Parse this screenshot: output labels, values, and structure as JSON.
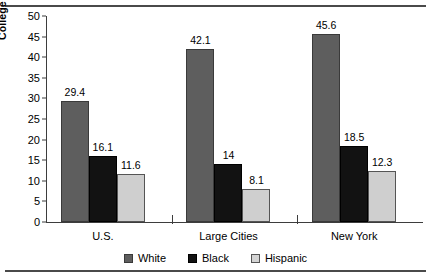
{
  "chart_data": {
    "type": "bar",
    "title": "",
    "xlabel": "",
    "ylabel": "College Graduates (Percent)",
    "categories": [
      "U.S.",
      "Large Cities",
      "New York"
    ],
    "series": [
      {
        "name": "White",
        "color": "#5e5e5e",
        "values": [
          29.4,
          42.1,
          45.6
        ],
        "labels": [
          "29.4",
          "42.1",
          "45.6"
        ]
      },
      {
        "name": "Black",
        "color": "#121212",
        "values": [
          16.1,
          14,
          18.5
        ],
        "labels": [
          "16.1",
          "14",
          "18.5"
        ]
      },
      {
        "name": "Hispanic",
        "color": "#cfcfcf",
        "values": [
          11.6,
          8.1,
          12.3
        ],
        "labels": [
          "11.6",
          "8.1",
          "12.3"
        ]
      }
    ],
    "ylim": [
      0,
      50
    ],
    "yticks": [
      0,
      5,
      10,
      15,
      20,
      25,
      30,
      35,
      40,
      45,
      50
    ],
    "ytick_labels": [
      "0",
      "5",
      "10",
      "15",
      "20",
      "25",
      "30",
      "35",
      "40",
      "45",
      "50"
    ],
    "grid": false,
    "legend_position": "bottom"
  },
  "legend": {
    "items": [
      {
        "label": "White"
      },
      {
        "label": "Black"
      },
      {
        "label": "Hispanic"
      }
    ]
  },
  "axis": {
    "y_title": "College Graduates (Percent)"
  }
}
